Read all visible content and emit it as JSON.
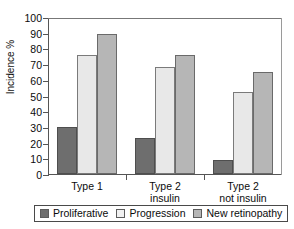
{
  "chart_data": {
    "type": "bar",
    "title": "",
    "xlabel": "",
    "ylabel": "Incidence %",
    "ylim": [
      0,
      100
    ],
    "yticks": [
      0,
      10,
      20,
      30,
      40,
      50,
      60,
      70,
      80,
      90,
      100
    ],
    "grid": false,
    "legend_position": "bottom",
    "categories": [
      "Type 1",
      "Type 2\ninsulin",
      "Type 2\nnot insulin"
    ],
    "series": [
      {
        "name": "Proliferative",
        "values": [
          30,
          23,
          9
        ],
        "color": "#6e6e6e"
      },
      {
        "name": "Progression",
        "values": [
          76,
          68,
          52
        ],
        "color": "#e8e8e8"
      },
      {
        "name": "New retinopathy",
        "values": [
          89,
          76,
          65
        ],
        "color": "#b6b6b6"
      }
    ]
  },
  "legend": {
    "items": [
      {
        "label": "Proliferative"
      },
      {
        "label": "Progression"
      },
      {
        "label": "New retinopathy"
      }
    ]
  }
}
